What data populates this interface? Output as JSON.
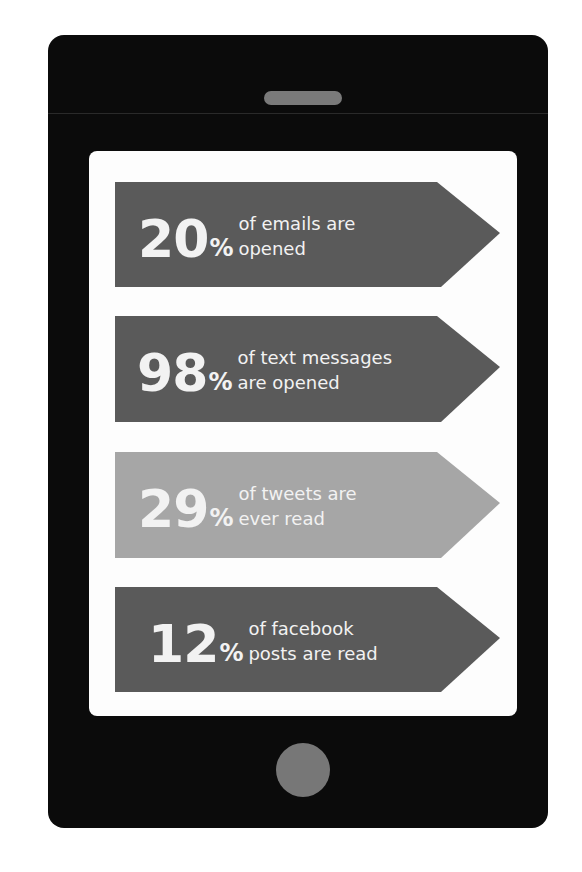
{
  "infographic": {
    "device": "smartphone",
    "colors": {
      "phone_body": "#0b0b0b",
      "screen": "#fdfdfd",
      "speaker": "#7a7a7a",
      "home_button": "#777777",
      "banner_dark": "#5a5a5a",
      "banner_light": "#a6a6a6",
      "text": "#f2f2f2"
    },
    "banners": [
      {
        "number": "20",
        "percent_sign": "%",
        "line1": "of emails are",
        "line2": "opened",
        "shade": "dark"
      },
      {
        "number": "98",
        "percent_sign": "%",
        "line1": "of text messages",
        "line2": "are opened",
        "shade": "dark"
      },
      {
        "number": "29",
        "percent_sign": "%",
        "line1": "of tweets are",
        "line2": "ever read",
        "shade": "light"
      },
      {
        "number": "12",
        "percent_sign": "%",
        "line1": "of facebook",
        "line2": "posts are read",
        "shade": "dark"
      }
    ]
  }
}
